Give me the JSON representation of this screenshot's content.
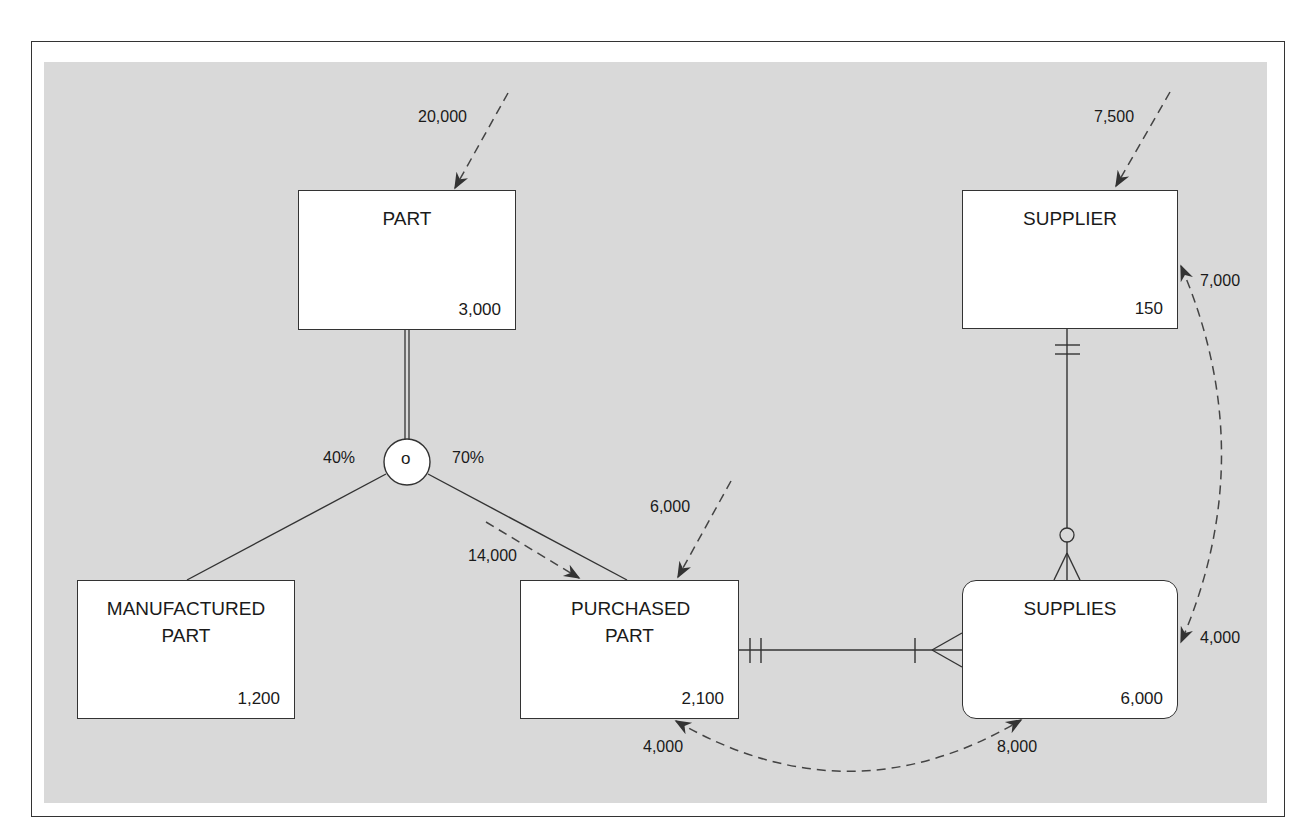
{
  "diagram": {
    "type": "composite-usage-map",
    "entities": [
      {
        "id": "part",
        "name": "PART",
        "count": "3,000"
      },
      {
        "id": "manufactured_part",
        "name": "MANUFACTURED PART",
        "count": "1,200"
      },
      {
        "id": "purchased_part",
        "name": "PURCHASED PART",
        "count": "2,100"
      },
      {
        "id": "supplier",
        "name": "SUPPLIER",
        "count": "150"
      },
      {
        "id": "supplies",
        "name": "SUPPLIES",
        "count": "6,000"
      }
    ],
    "subtype_symbol": {
      "label": "o",
      "meaning": "overlap"
    },
    "subtype_percentages": {
      "manufactured_part": "40%",
      "purchased_part": "70%"
    },
    "access_frequencies": {
      "part_direct": "20,000",
      "purchased_part_via_part": "14,000",
      "purchased_part_direct": "6,000",
      "supplier_direct": "7,500",
      "supplier_from_supplies": "7,000",
      "supplies_from_supplier": "4,000",
      "purchased_part_from_supplies": "4,000",
      "supplies_from_purchased_part": "8,000"
    },
    "relationships": [
      {
        "from": "PART",
        "to": "SUBTYPES",
        "kind": "total-specialization (double line)"
      },
      {
        "from": "PURCHASED PART",
        "to": "SUPPLIES",
        "cardinality_from": "one-and-only-one",
        "cardinality_to": "one-or-many"
      },
      {
        "from": "SUPPLIER",
        "to": "SUPPLIES",
        "cardinality_from": "one-and-only-one",
        "cardinality_to": "zero-or-many"
      }
    ]
  }
}
